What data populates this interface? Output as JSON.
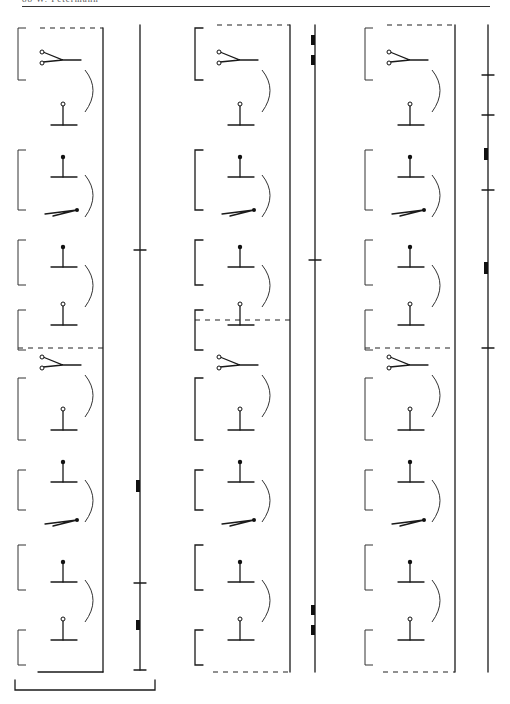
{
  "page": {
    "running_header": "88   W. Petermann"
  },
  "columns": [
    {
      "id": "col-1",
      "box": {
        "x": 28,
        "y1": 28,
        "y2": 672,
        "right": 103,
        "dash_top": true,
        "dash_mid_y": 348,
        "dash_bottom": false
      },
      "side_staff": {
        "x": 140,
        "y1": 25,
        "y2": 670,
        "ticks": [
          250,
          583,
          670
        ],
        "blocks": [
          {
            "y": 480,
            "h": 12
          },
          {
            "y": 620,
            "h": 10
          }
        ]
      },
      "bracket_bottom": {
        "x1": 15,
        "x2": 155,
        "y": 690
      }
    },
    {
      "id": "col-2",
      "box": {
        "x": 205,
        "y1": 25,
        "y2": 672,
        "right": 290,
        "dash_top": true,
        "dash_mid_y": 320,
        "dash_bottom": true
      },
      "side_staff": {
        "x": 315,
        "y1": 25,
        "y2": 672,
        "ticks": [
          260
        ],
        "blocks": [
          {
            "y": 35,
            "h": 10
          },
          {
            "y": 55,
            "h": 10
          },
          {
            "y": 605,
            "h": 10
          },
          {
            "y": 625,
            "h": 10
          }
        ]
      }
    },
    {
      "id": "col-3",
      "box": {
        "x": 375,
        "y1": 25,
        "y2": 672,
        "right": 455,
        "dash_top": true,
        "dash_mid_y": 348,
        "dash_bottom": true
      },
      "side_staff": {
        "x": 488,
        "y1": 25,
        "y2": 672,
        "ticks": [
          75,
          115,
          190,
          348
        ],
        "blocks": [
          {
            "y": 148,
            "h": 12
          },
          {
            "y": 262,
            "h": 12
          }
        ]
      }
    }
  ],
  "figure_rows_y": [
    60,
    110,
    165,
    210,
    255,
    310,
    365,
    415,
    470,
    520,
    570,
    625
  ]
}
